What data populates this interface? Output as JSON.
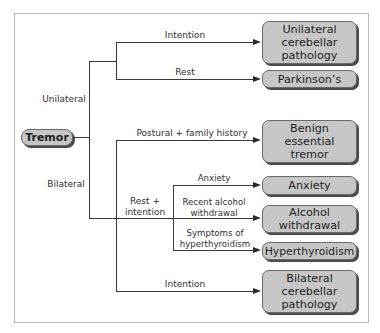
{
  "root": {
    "label": "Tremor"
  },
  "groups": {
    "unilateral": "Unilateral",
    "bilateral": "Bilateral"
  },
  "edge_labels": {
    "intention_uni": "Intention",
    "rest": "Rest",
    "postural": "Postural + family history",
    "rest_intention": "Rest +\nintention",
    "anxiety": "Anxiety",
    "alcohol": "Recent alcohol\nwithdrawal",
    "hyper": "Symptoms of\nhyperthyroidism",
    "intention_bi": "Intention"
  },
  "outcomes": [
    {
      "id": "unilateral-cerebellar",
      "label": "Unilateral\ncerebellar\npathology"
    },
    {
      "id": "parkinsons",
      "label": "Parkinson’s"
    },
    {
      "id": "benign-essential-tremor",
      "label": "Benign\nessential\ntremor"
    },
    {
      "id": "anxiety",
      "label": "Anxiety"
    },
    {
      "id": "alcohol-withdrawal",
      "label": "Alcohol\nwithdrawal"
    },
    {
      "id": "hyperthyroidism",
      "label": "Hyperthyroidism"
    },
    {
      "id": "bilateral-cerebellar",
      "label": "Bilateral\ncerebellar\npathology"
    }
  ],
  "colors": {
    "box_fill": "#c6c6c6",
    "shadow": "#4a4a4a",
    "line": "#3a3a3a"
  }
}
